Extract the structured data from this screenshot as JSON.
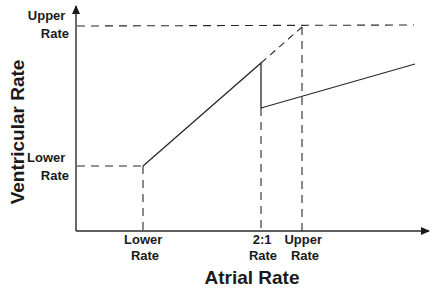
{
  "diagram": {
    "x_axis": {
      "title": "Atrial Rate",
      "ticks": [
        {
          "line1": "Lower",
          "line2": "Rate"
        },
        {
          "line1": "2:1",
          "line2": "Rate"
        },
        {
          "line1": "Upper",
          "line2": "Rate"
        }
      ]
    },
    "y_axis": {
      "title": "Ventricular Rate",
      "ticks": [
        {
          "line1": "Upper",
          "line2": "Rate"
        },
        {
          "line1": "Lower",
          "line2": "Rate"
        }
      ]
    },
    "colors": {
      "line": "#2a2a2a",
      "text": "#1a1a1a",
      "background": "#ffffff"
    }
  }
}
